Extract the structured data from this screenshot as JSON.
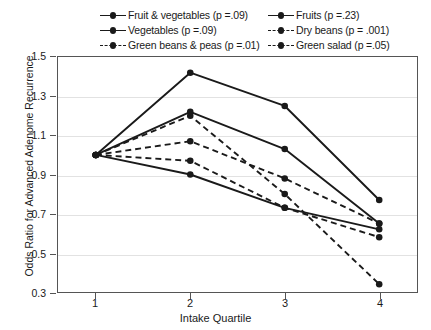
{
  "chart_data": {
    "type": "line",
    "title": "",
    "xlabel": "Intake Quartile",
    "ylabel": "Odds Ratio for Advanced Adenome Recurrence",
    "categories": [
      "1",
      "2",
      "3",
      "4"
    ],
    "x": [
      1,
      2,
      3,
      4
    ],
    "xlim": [
      0.6,
      4.4
    ],
    "ylim": [
      0.3,
      1.5
    ],
    "yticks": [
      "0.3",
      "0.5",
      "0.7",
      "0.9",
      "1.1",
      "1.3",
      "1.5"
    ],
    "ytick_values": [
      0.3,
      0.5,
      0.7,
      0.9,
      1.1,
      1.3,
      1.5
    ],
    "grid": true,
    "legend_position": "top",
    "marker": "circle",
    "line_color": "#1a1a1a",
    "series": [
      {
        "name": "Fruit & vegetables (p =.09)",
        "label": "Fruit & vegetables",
        "p_value": "p =.09",
        "style": "solid",
        "values": [
          1.0,
          1.42,
          1.25,
          0.77
        ]
      },
      {
        "name": "Fruits (p =.23)",
        "label": "Fruits",
        "p_value": "p =.23",
        "style": "solid",
        "values": [
          1.0,
          1.22,
          1.03,
          0.65
        ]
      },
      {
        "name": "Vegetables (p =.09)",
        "label": "Vegetables",
        "p_value": "p =.09",
        "style": "solid",
        "values": [
          1.0,
          0.9,
          0.73,
          0.62
        ]
      },
      {
        "name": "Dry beans (p = .001)",
        "label": "Dry beans",
        "p_value": "p = .001",
        "style": "dashed",
        "values": [
          1.0,
          0.97,
          0.73,
          0.58
        ]
      },
      {
        "name": "Green beans & peas (p =.01)",
        "label": "Green beans & peas",
        "p_value": "p =.01",
        "style": "dashed",
        "values": [
          1.0,
          1.07,
          0.88,
          0.65
        ]
      },
      {
        "name": "Green salad (p =.05)",
        "label": "Green salad",
        "p_value": "p =.05",
        "style": "dashed",
        "values": [
          1.0,
          1.2,
          0.8,
          0.34
        ]
      }
    ]
  },
  "legend": {
    "entries": [
      {
        "text": "Fruit & vegetables (p =.09)",
        "style": "solid"
      },
      {
        "text": "Fruits (p =.23)",
        "style": "solid"
      },
      {
        "text": "Vegetables (p =.09)",
        "style": "solid"
      },
      {
        "text": "Dry beans (p = .001)",
        "style": "dashed"
      },
      {
        "text": "Green beans & peas (p =.01)",
        "style": "dashed"
      },
      {
        "text": "Green salad (p =.05)",
        "style": "dashed"
      }
    ]
  }
}
